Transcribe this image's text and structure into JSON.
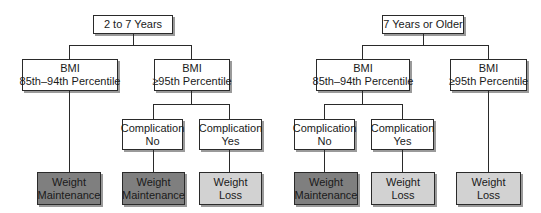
{
  "left_tree": {
    "root": "2 to 7 Years",
    "bmi_low": [
      "BMI",
      "85th–94th Percentile"
    ],
    "bmi_high": [
      "BMI",
      "≥95th Percentile"
    ],
    "comp_no": [
      "Complication",
      "No"
    ],
    "comp_yes": [
      "Complication",
      "Yes"
    ],
    "out_1": [
      "Weight",
      "Maintenance"
    ],
    "out_2": [
      "Weight",
      "Maintenance"
    ],
    "out_3": [
      "Weight",
      "Loss"
    ]
  },
  "right_tree": {
    "root": "7 Years or Older",
    "bmi_low": [
      "BMI",
      "85th–94th Percentile"
    ],
    "bmi_high": [
      "BMI",
      "≥95th Percentile"
    ],
    "comp_no": [
      "Complication",
      "No"
    ],
    "comp_yes": [
      "Complication",
      "Yes"
    ],
    "out_1": [
      "Weight",
      "Maintenance"
    ],
    "out_2": [
      "Weight",
      "Loss"
    ],
    "out_3": [
      "Weight",
      "Loss"
    ]
  },
  "colors": {
    "maintenance_fill": "#7f7f7f",
    "loss_fill": "#d2d2d2",
    "decision_fill": "#ffffff",
    "line": "#2a2a2a"
  }
}
